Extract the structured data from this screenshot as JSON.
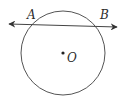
{
  "diagram": {
    "type": "geometry",
    "colors": {
      "stroke": "#555555",
      "text": "#2b2b2b",
      "background": "#ffffff"
    },
    "circle": {
      "center_label": "O",
      "cx": 63,
      "cy": 53,
      "r": 42
    },
    "secant": {
      "start": [
        8,
        24
      ],
      "end": [
        118,
        27
      ],
      "double_arrow": true
    },
    "points": [
      {
        "label": "A",
        "x": 27,
        "y": 16
      },
      {
        "label": "B",
        "x": 100,
        "y": 16
      }
    ],
    "center_point": {
      "label": "O",
      "x": 63,
      "y": 53,
      "label_x": 67,
      "label_y": 62
    }
  }
}
